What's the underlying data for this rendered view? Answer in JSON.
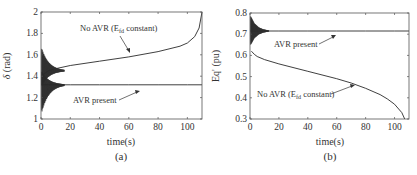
{
  "chart_data": [
    {
      "type": "line",
      "panel": "(a)",
      "title": "",
      "caption": "(a)",
      "xlabel": "time(s)",
      "ylabel": "δ (rad)",
      "xlim": [
        0,
        110
      ],
      "ylim": [
        1,
        2
      ],
      "xticks": [
        0,
        20,
        40,
        60,
        80,
        100
      ],
      "yticks": [
        1,
        1.2,
        1.4,
        1.6,
        1.8,
        2
      ],
      "ytick_labels": [
        "1",
        "1.2",
        "1.4",
        "1.6",
        "1.8",
        "2"
      ],
      "grid": false,
      "series": [
        {
          "name": "No AVR (Efd constant)",
          "x": [
            0,
            2,
            5,
            10,
            20,
            40,
            60,
            80,
            95,
            100,
            105,
            108,
            110
          ],
          "y": [
            1.4,
            1.42,
            1.45,
            1.47,
            1.5,
            1.54,
            1.58,
            1.63,
            1.68,
            1.71,
            1.77,
            1.85,
            2.0
          ],
          "note": "large oscillation at start, envelope ~1.3–1.67 decaying by t≈15s"
        },
        {
          "name": "AVR present",
          "x": [
            0,
            2,
            5,
            10,
            15,
            20,
            40,
            60,
            80,
            100,
            110
          ],
          "y": [
            1.32,
            1.32,
            1.32,
            1.32,
            1.32,
            1.32,
            1.32,
            1.32,
            1.32,
            1.32,
            1.32
          ],
          "note": "large oscillation at start, envelope ~1.05–1.45 decaying by t≈15s"
        }
      ],
      "annotations": [
        {
          "text": "No AVR (E",
          "sub": "fd",
          "suffix": " constant)",
          "x": 45,
          "y": 1.85
        },
        {
          "text": "AVR present",
          "x": 20,
          "y": 1.15
        }
      ]
    },
    {
      "type": "line",
      "panel": "(b)",
      "title": "",
      "caption": "(b)",
      "xlabel": "time(s)",
      "ylabel": "Eq' (pu)",
      "xlim": [
        0,
        110
      ],
      "ylim": [
        0.3,
        0.8
      ],
      "xticks": [
        0,
        20,
        40,
        60,
        80,
        100
      ],
      "yticks": [
        0.3,
        0.4,
        0.5,
        0.6,
        0.7,
        0.8
      ],
      "ytick_labels": [
        "0.3",
        "0.4",
        "0.5",
        "0.6",
        "0.7",
        "0.8"
      ],
      "grid": false,
      "series": [
        {
          "name": "AVR present",
          "x": [
            0,
            2,
            5,
            10,
            20,
            40,
            60,
            80,
            100,
            110
          ],
          "y": [
            0.715,
            0.715,
            0.715,
            0.715,
            0.715,
            0.715,
            0.715,
            0.715,
            0.715,
            0.715
          ],
          "note": "oscillation at start, envelope ~0.64–0.79 decaying by t≈12s"
        },
        {
          "name": "No AVR (Efd constant)",
          "x": [
            1,
            3,
            5,
            10,
            20,
            40,
            60,
            70,
            80,
            90,
            95,
            100,
            105,
            107
          ],
          "y": [
            0.62,
            0.605,
            0.595,
            0.58,
            0.56,
            0.525,
            0.49,
            0.47,
            0.445,
            0.415,
            0.395,
            0.37,
            0.33,
            0.3
          ]
        }
      ],
      "annotations": [
        {
          "text": "AVR present",
          "x": 18,
          "y": 0.655
        },
        {
          "text": "No AVR (E",
          "sub": "fd",
          "suffix": " constant)",
          "x": 5,
          "y": 0.43
        }
      ]
    }
  ],
  "labels": {
    "a": {
      "ylabel_sym": "δ",
      "ylabel_unit": " (rad)",
      "xlabel": "time(s)",
      "caption": "(a)",
      "ann_noavr_pre": "No AVR (E",
      "ann_noavr_sub": "fd",
      "ann_noavr_post": " constant)",
      "ann_avr": "AVR present"
    },
    "b": {
      "ylabel": "Eq' (pu)",
      "xlabel": "time(s)",
      "caption": "(b)",
      "ann_noavr_pre": "No AVR (E",
      "ann_noavr_sub": "fd",
      "ann_noavr_post": " constant)",
      "ann_avr": "AVR present"
    }
  },
  "colors": {
    "line": "#2a2a2a",
    "axis": "#555555",
    "text": "#333333"
  }
}
